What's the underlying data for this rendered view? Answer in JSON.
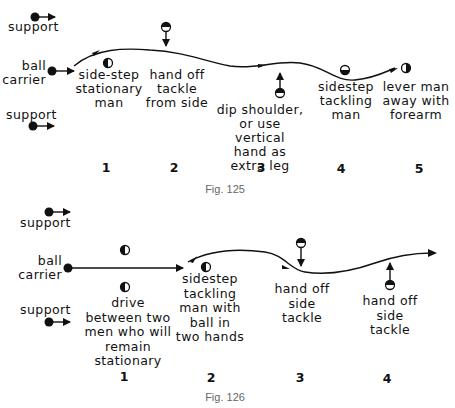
{
  "top_cut_text": "g",
  "fig125": {
    "caption": "Fig. 125",
    "left_labels": {
      "support_top": "support",
      "ball_carrier": "ball\ncarrier",
      "support_bottom": "support"
    },
    "steps": [
      {
        "number": "1",
        "label": "side-step\nstationary\nman"
      },
      {
        "number": "2",
        "label": "hand off\ntackle\nfrom side"
      },
      {
        "number": "3",
        "label": "dip shoulder,\nor use vertical\nhand as\nextra leg"
      },
      {
        "number": "4",
        "label": "sidestep\ntackling\nman"
      },
      {
        "number": "5",
        "label": "lever man\naway with\nforearm"
      }
    ]
  },
  "fig126": {
    "caption": "Fig. 126",
    "left_labels": {
      "support_top": "support",
      "ball_carrier": "ball\ncarrier",
      "support_bottom": "support"
    },
    "steps": [
      {
        "number": "1",
        "label": "drive\nbetween two\nmen who will\nremain\nstationary"
      },
      {
        "number": "2",
        "label": "sidestep\ntackling\nman with\nball in\ntwo hands"
      },
      {
        "number": "3",
        "label": "hand off\nside\ntackle"
      },
      {
        "number": "4",
        "label": "hand off\nside\ntackle"
      }
    ]
  },
  "symbols": {
    "attacker": "filled-circle",
    "defender_stationary": "half-filled-circle-left-right",
    "defender_tackling": "half-filled-circle-top-bottom"
  }
}
